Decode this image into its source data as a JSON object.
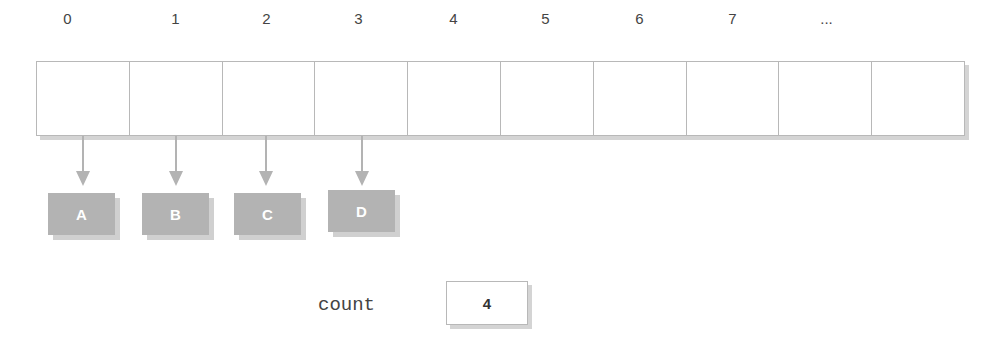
{
  "array": {
    "indices": [
      "0",
      "1",
      "2",
      "3",
      "4",
      "5",
      "6",
      "7",
      "..."
    ],
    "cell_count": 10
  },
  "nodes": [
    {
      "label": "A",
      "index": 0
    },
    {
      "label": "B",
      "index": 1
    },
    {
      "label": "C",
      "index": 2
    },
    {
      "label": "D",
      "index": 3
    }
  ],
  "count": {
    "label": "count",
    "value": "4"
  },
  "colors": {
    "node_fill": "#b3b3b3",
    "border": "#b8b8b8",
    "arrow": "#b3b3b3"
  }
}
